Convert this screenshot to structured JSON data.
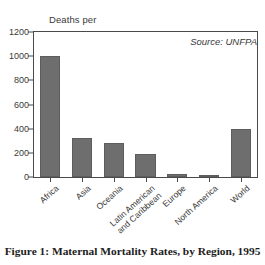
{
  "chart_data": {
    "type": "bar",
    "title": "",
    "xlabel": "",
    "ylabel": "Deaths per\n100,000 Live Births",
    "ylabel_line1": "Deaths per",
    "ylabel_line2": "100,000 Live Births",
    "ylim": [
      0,
      1200
    ],
    "yticks": [
      0,
      200,
      400,
      600,
      800,
      1000,
      1200
    ],
    "ytick_labels": [
      "0",
      "200",
      "400",
      "600",
      "800",
      "1000",
      "1200"
    ],
    "grid": false,
    "legend": null,
    "categories": [
      "Africa",
      "Asia",
      "Oceania",
      "Latin American\nand Caribbean",
      "Europe",
      "North America",
      "World"
    ],
    "values": [
      1000,
      320,
      280,
      190,
      28,
      11,
      395
    ],
    "annotations": [
      {
        "text": "Source: UNFPA",
        "position": "top-right",
        "style": "italic"
      }
    ],
    "bar_color": "#6e6e6e",
    "frame_color": "#4a4a4a"
  },
  "category_labels": [
    {
      "line1": "Africa",
      "line2": ""
    },
    {
      "line1": "Asia",
      "line2": ""
    },
    {
      "line1": "Oceania",
      "line2": ""
    },
    {
      "line1": "Latin American",
      "line2": "and Caribbean"
    },
    {
      "line1": "Europe",
      "line2": ""
    },
    {
      "line1": "North America",
      "line2": ""
    },
    {
      "line1": "World",
      "line2": ""
    }
  ],
  "source_note": "Source: UNFPA",
  "caption": "Figure 1: Maternal Mortality Rates, by Region, 1995"
}
